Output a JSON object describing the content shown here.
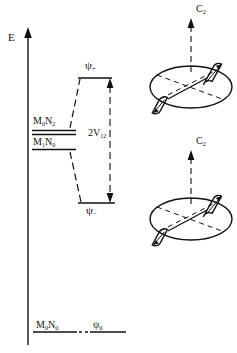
{
  "figure": {
    "type": "energy-level-correlation-diagram",
    "axis": {
      "label": "E",
      "direction": "up",
      "meaning": "energy"
    },
    "levels": [
      {
        "id": "degenerate-upper",
        "label": "M₀N₂",
        "side": "left",
        "y_px": 131
      },
      {
        "id": "degenerate-lower",
        "label": "M₁N₀",
        "side": "left",
        "y_px": 148
      },
      {
        "id": "psi-plus",
        "label": "ψ₊",
        "side": "right",
        "y_px": 78
      },
      {
        "id": "psi-minus",
        "label": "ψ₋",
        "side": "right",
        "y_px": 203
      },
      {
        "id": "ground-left",
        "label": "M₀N₀",
        "side": "left",
        "y_px": 332
      },
      {
        "id": "ground-right",
        "label": "ψ₀",
        "side": "right",
        "y_px": 332
      }
    ],
    "splitting": {
      "label": "2V₁₂",
      "between": [
        "psi-plus",
        "psi-minus"
      ]
    },
    "molecules": [
      {
        "id": "molecule-top",
        "axis_label": "C₂"
      },
      {
        "id": "molecule-bottom",
        "axis_label": "C₂"
      }
    ]
  },
  "labels": {
    "energy_axis": "E",
    "psi_plus": "ψ",
    "psi_plus_sub": "+",
    "psi_minus": "ψ",
    "psi_minus_sub": "−",
    "coupling": "2V",
    "coupling_sub": "12",
    "excited_upper": "M",
    "excited_upper_sub1": "0",
    "excited_upper_mid": "N",
    "excited_upper_sub2": "2",
    "excited_lower": "M",
    "excited_lower_sub1": "1",
    "excited_lower_mid": "N",
    "excited_lower_sub2": "0",
    "ground_left": "M",
    "ground_left_sub1": "0",
    "ground_left_mid": "N",
    "ground_left_sub2": "0",
    "ground_right": "ψ",
    "ground_right_sub": "0",
    "c2_top": "C",
    "c2_top_sub": "2",
    "c2_bottom": "C",
    "c2_bottom_sub": "2"
  },
  "colors": {
    "ink": "#111111",
    "background": "#ffffff"
  }
}
